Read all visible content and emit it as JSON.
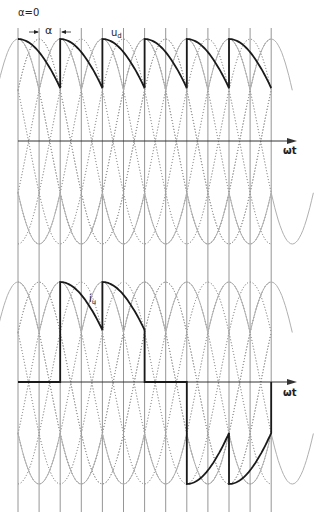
{
  "figure": {
    "type": "waveform-diagram",
    "labels": {
      "alpha_zero": "α=0",
      "alpha": "α",
      "ud": "u",
      "ud_sub": "d",
      "iu": "i",
      "iu_sub": "u",
      "axis_top": "ωt",
      "axis_bottom": "ωt"
    },
    "colors": {
      "grid_line": "#8a8a8a",
      "dotted_curve": "#9a9a9a",
      "envelope_curve": "#b0b0b0",
      "waveform": "#1a1a1a",
      "axis": "#333333"
    },
    "grid": {
      "vertical_line_count": 13,
      "x_start": 18,
      "spacing": 21.1,
      "top": 28,
      "bottom": 512
    },
    "upper_panel": {
      "axis_y": 141,
      "peak_y": 39,
      "ud_low_y": 88,
      "trough_y": 244,
      "pulses": 6
    },
    "lower_panel": {
      "axis_y": 382,
      "peak_y": 282,
      "iu_low_y": 330,
      "neg_peak_y": 484,
      "neg_high_y": 433
    }
  }
}
